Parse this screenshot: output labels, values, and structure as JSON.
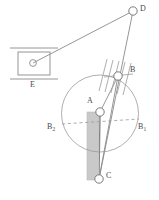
{
  "figure": {
    "background_color": "#ffffff",
    "stroke_color": "#7a7a7a",
    "label_color": "#4a4a4a",
    "slider_fill": "#c9c9c9",
    "node_fill": "#ffffff",
    "width": 159,
    "height": 200
  },
  "labels": {
    "D": "D",
    "B": "B",
    "A": "A",
    "C": "C",
    "E": "E",
    "B1": "B",
    "B1_sub": "1",
    "B2": "B",
    "B2_sub": "2"
  },
  "nodes": [
    {
      "name": "D",
      "x": 133,
      "y": 11,
      "r": 4.2,
      "label": "D",
      "label_x": 140,
      "label_y": 7
    },
    {
      "name": "B",
      "x": 118,
      "y": 76,
      "r": 4.2,
      "label": "B",
      "label_x": 131,
      "label_y": 68
    },
    {
      "name": "A",
      "x": 100,
      "y": 112,
      "r": 4.2,
      "label": "A",
      "label_x": 88,
      "label_y": 99
    },
    {
      "name": "C",
      "x": 99,
      "y": 179,
      "r": 4.2,
      "label": "C",
      "label_x": 106,
      "label_y": 174
    },
    {
      "name": "E_pulley",
      "x": 33,
      "y": 63,
      "r": 3.4,
      "label": "E",
      "label_x": 30,
      "label_y": 82
    }
  ],
  "circle": {
    "cx": 100,
    "cy": 113.5,
    "r": 38.5
  },
  "dashed_axis": {
    "x1": 62,
    "y1": 124,
    "x2": 139,
    "y2": 119
  },
  "slider": {
    "x": 87,
    "y": 112,
    "width": 12,
    "height": 68
  },
  "links": [
    {
      "from": "D",
      "to": "E_pulley"
    },
    {
      "from": "D",
      "to": "C"
    },
    {
      "from": "B",
      "to": "A"
    },
    {
      "from": "B",
      "to": "C"
    },
    {
      "from": "A",
      "to": "C"
    }
  ],
  "ground": {
    "box": {
      "x": 18,
      "y": 52,
      "width": 32,
      "height": 23
    },
    "upper_rail_y": 48,
    "lower_rail_y": 79,
    "rail_x1": 10,
    "rail_x2": 58
  },
  "hatching_at_B": {
    "count": 5,
    "angle_deg": 20
  }
}
